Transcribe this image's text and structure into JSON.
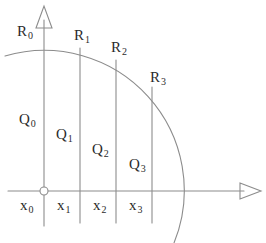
{
  "figure": {
    "background_color": "#ffffff",
    "stroke_color": "#8c8c8c",
    "text_color": "#2b2b2b",
    "width": 266,
    "height": 243
  },
  "axes": {
    "y_axis": {
      "name": "y-axis",
      "x": 44,
      "y_top": 6,
      "y_bottom": 225,
      "arrow": "up"
    },
    "x_axis": {
      "name": "x-axis",
      "y": 191,
      "x_left": 8,
      "x_right": 260,
      "arrow": "right"
    },
    "origin": {
      "name": "origin-marker",
      "x": 44,
      "y": 191,
      "radius": 4
    }
  },
  "arc": {
    "name": "quarter-circle-arc",
    "center_x": 44,
    "center_y": 191,
    "radius": 140,
    "description": "arc of a circle centered at the origin"
  },
  "partition_lines": [
    {
      "label": "x_1",
      "x": 80
    },
    {
      "label": "x_2",
      "x": 116
    },
    {
      "label": "x_3",
      "x": 152
    }
  ],
  "labels": {
    "r": [
      {
        "id": "R0",
        "base": "R",
        "sub": "0",
        "x": 17,
        "y": 24
      },
      {
        "id": "R1",
        "base": "R",
        "sub": "1",
        "x": 74,
        "y": 28
      },
      {
        "id": "R2",
        "base": "R",
        "sub": "2",
        "x": 111,
        "y": 40
      },
      {
        "id": "R3",
        "base": "R",
        "sub": "3",
        "x": 150,
        "y": 70
      }
    ],
    "q": [
      {
        "id": "Q0",
        "base": "Q",
        "sub": "0",
        "x": 19,
        "y": 112
      },
      {
        "id": "Q1",
        "base": "Q",
        "sub": "1",
        "x": 56,
        "y": 127
      },
      {
        "id": "Q2",
        "base": "Q",
        "sub": "2",
        "x": 92,
        "y": 142
      },
      {
        "id": "Q3",
        "base": "Q",
        "sub": "3",
        "x": 129,
        "y": 157
      }
    ],
    "x": [
      {
        "id": "x0",
        "base": "x",
        "sub": "0",
        "x": 20,
        "y": 198
      },
      {
        "id": "x1",
        "base": "x",
        "sub": "1",
        "x": 57,
        "y": 198
      },
      {
        "id": "x2",
        "base": "x",
        "sub": "2",
        "x": 93,
        "y": 198
      },
      {
        "id": "x3",
        "base": "x",
        "sub": "3",
        "x": 129,
        "y": 198
      }
    ]
  }
}
